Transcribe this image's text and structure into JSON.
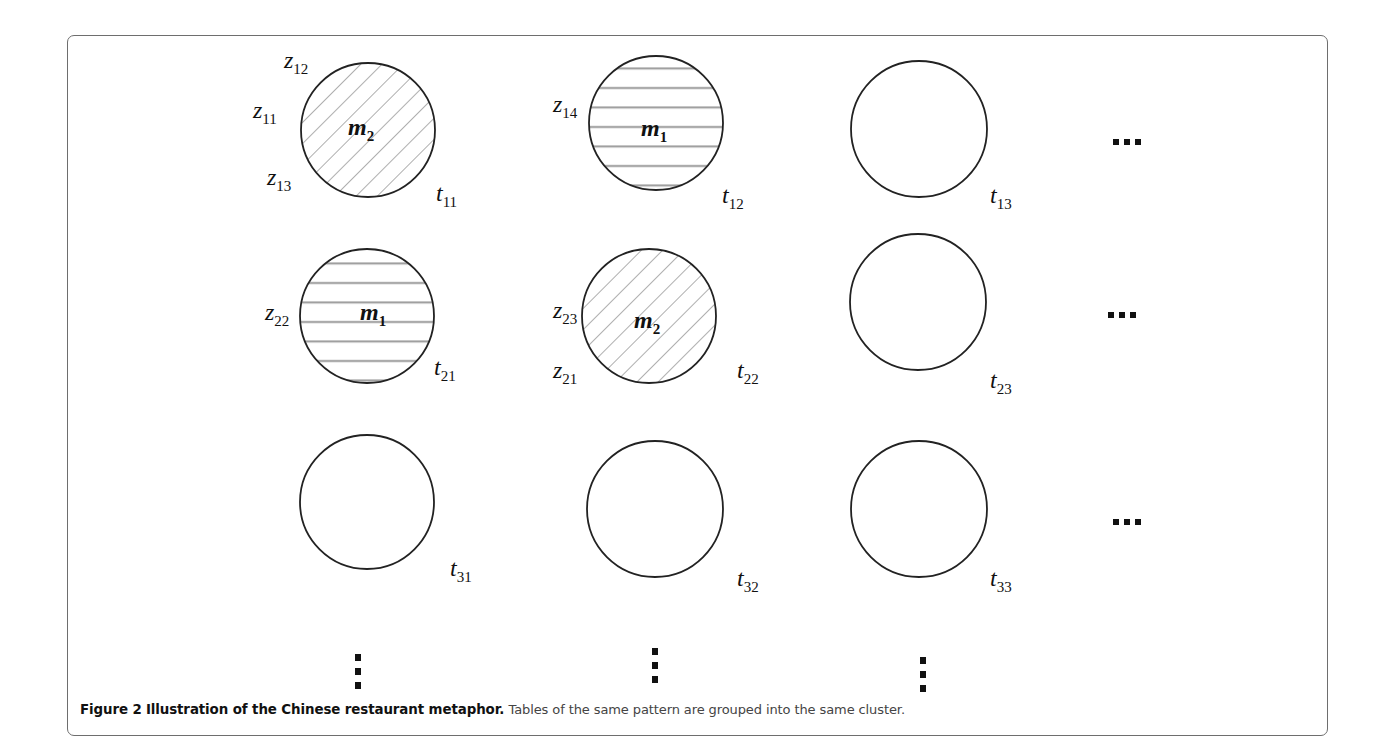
{
  "figure": {
    "caption_label": "Figure 2",
    "caption_title": "Illustration of the Chinese restaurant metaphor.",
    "caption_text": "Tables of the same pattern are grouped into the same cluster.",
    "pattern_colors": {
      "hatch": "#9a9a9a",
      "stroke": "#222222",
      "frame": "#6e6e6e"
    }
  },
  "tables": [
    {
      "id": "t11",
      "row": 1,
      "col": 1,
      "base": "t",
      "sub": "11",
      "pattern": "diagonal",
      "dish": "m",
      "dish_sub": "2",
      "customers": [
        {
          "base": "z",
          "sub": "12"
        },
        {
          "base": "z",
          "sub": "11"
        },
        {
          "base": "z",
          "sub": "13"
        }
      ]
    },
    {
      "id": "t12",
      "row": 1,
      "col": 2,
      "base": "t",
      "sub": "12",
      "pattern": "horizontal",
      "dish": "m",
      "dish_sub": "1",
      "customers": [
        {
          "base": "z",
          "sub": "14"
        }
      ]
    },
    {
      "id": "t13",
      "row": 1,
      "col": 3,
      "base": "t",
      "sub": "13",
      "pattern": "none"
    },
    {
      "id": "t21",
      "row": 2,
      "col": 1,
      "base": "t",
      "sub": "21",
      "pattern": "horizontal",
      "dish": "m",
      "dish_sub": "1",
      "customers": [
        {
          "base": "z",
          "sub": "22"
        }
      ]
    },
    {
      "id": "t22",
      "row": 2,
      "col": 2,
      "base": "t",
      "sub": "22",
      "pattern": "diagonal",
      "dish": "m",
      "dish_sub": "2",
      "customers": [
        {
          "base": "z",
          "sub": "23"
        },
        {
          "base": "z",
          "sub": "21"
        }
      ]
    },
    {
      "id": "t23",
      "row": 2,
      "col": 3,
      "base": "t",
      "sub": "23",
      "pattern": "none"
    },
    {
      "id": "t31",
      "row": 3,
      "col": 1,
      "base": "t",
      "sub": "31",
      "pattern": "none"
    },
    {
      "id": "t32",
      "row": 3,
      "col": 2,
      "base": "t",
      "sub": "32",
      "pattern": "none"
    },
    {
      "id": "t33",
      "row": 3,
      "col": 3,
      "base": "t",
      "sub": "33",
      "pattern": "none"
    }
  ],
  "continuation": {
    "horizontal": "...",
    "vertical": "⋮"
  }
}
